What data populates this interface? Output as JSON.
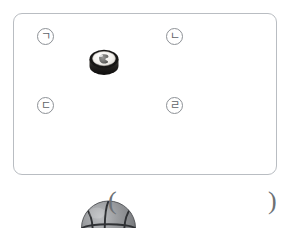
{
  "question": {
    "panel_name": "multiple-choice-illustration-panel",
    "choices": [
      {
        "marker": "ㄱ",
        "marker_symbol": "㉠",
        "item_name": "sushi-roll",
        "item_label": "김밥 (gimbap / sushi roll)",
        "shape": "cylinder",
        "colors": {
          "seaweed": "#2b2b2b",
          "rice": "#f2f0ec",
          "filling": "#6f6f6f"
        }
      },
      {
        "marker": "ㄴ",
        "marker_symbol": "㉡",
        "item_name": "pineapple-can",
        "item_label": "파인애플 통조림 (canned pineapple)",
        "shape": "cylinder",
        "colors": {
          "body": "#c9cbc9",
          "lid": "#b4b7b4",
          "outline": "#7e817e"
        }
      },
      {
        "marker": "ㄷ",
        "marker_symbol": "㉢",
        "item_name": "basketball",
        "item_label": "농구공 (basketball)",
        "shape": "sphere",
        "colors": {
          "body": "#8f9194",
          "seam": "#2f3134",
          "highlight": "#b9babd"
        }
      },
      {
        "marker": "ㄹ",
        "marker_symbol": "㉣",
        "item_name": "nightstand",
        "item_label": "서랍장 (two-drawer nightstand)",
        "shape": "rectangular-prism",
        "drawer_count": 2,
        "colors": {
          "front": "#e9eaec",
          "top": "#d3d5d8",
          "side": "#a9acb0",
          "handle": "#2e3032",
          "outline": "#85888c"
        }
      }
    ],
    "answer_blank": {
      "open_paren": "(",
      "close_paren": ")",
      "value": ""
    }
  },
  "style": {
    "panel_border_color": "#b9bdc2",
    "marker_border_color": "#8d9196",
    "marker_text_color": "#5e6368",
    "paren_color": "#6d7175",
    "background": "#ffffff"
  }
}
